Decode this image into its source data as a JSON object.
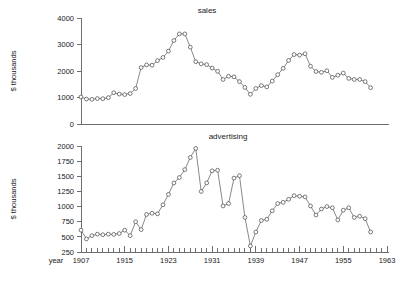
{
  "figure": {
    "ylabel": "$ thousands",
    "xlabel": "year"
  },
  "chart_data": [
    {
      "type": "line",
      "title": "sales",
      "xlabel": "",
      "ylabel": "$ thousands",
      "ylim": [
        0,
        4000
      ],
      "yticks": [
        0,
        1000,
        2000,
        3000,
        4000
      ],
      "yticklabels": [
        "0",
        "1000",
        "2000",
        "3000",
        "4000"
      ],
      "xlim": [
        1907,
        1963
      ],
      "xticks": [
        1907,
        1915,
        1923,
        1931,
        1939,
        1947,
        1955,
        1963
      ],
      "xticklabels": [
        "1907",
        "1915",
        "1923",
        "1931",
        "1939",
        "1947",
        "1955",
        "1963"
      ],
      "minor_xtick_step": 1,
      "grid": false,
      "legend": "none",
      "marker": "open-circle",
      "x": [
        1907,
        1908,
        1909,
        1910,
        1911,
        1912,
        1913,
        1914,
        1915,
        1916,
        1917,
        1918,
        1919,
        1920,
        1921,
        1922,
        1923,
        1924,
        1925,
        1926,
        1927,
        1928,
        1929,
        1930,
        1931,
        1932,
        1933,
        1934,
        1935,
        1936,
        1937,
        1938,
        1939,
        1940,
        1941,
        1942,
        1943,
        1944,
        1945,
        1946,
        1947,
        1948,
        1949,
        1950,
        1951,
        1952,
        1953,
        1954,
        1955,
        1956,
        1957,
        1958,
        1959,
        1960
      ],
      "values": [
        1020,
        940,
        930,
        960,
        955,
        995,
        1180,
        1130,
        1110,
        1150,
        1340,
        2130,
        2230,
        2220,
        2390,
        2510,
        2750,
        3150,
        3400,
        3400,
        2900,
        2350,
        2270,
        2240,
        2110,
        1990,
        1680,
        1800,
        1780,
        1600,
        1380,
        1120,
        1340,
        1450,
        1400,
        1620,
        1860,
        2100,
        2400,
        2620,
        2600,
        2650,
        2180,
        1980,
        1950,
        2010,
        1760,
        1840,
        1920,
        1720,
        1680,
        1680,
        1600,
        1370
      ]
    },
    {
      "type": "line",
      "title": "advertising",
      "xlabel": "year",
      "ylabel": "$ thousands",
      "ylim": [
        250,
        2000
      ],
      "yticks": [
        250,
        500,
        750,
        1000,
        1250,
        1500,
        1750,
        2000
      ],
      "yticklabels": [
        "250",
        "500",
        "750",
        "1000",
        "1250",
        "1500",
        "1750",
        "2000"
      ],
      "xlim": [
        1907,
        1963
      ],
      "xticks": [
        1907,
        1915,
        1923,
        1931,
        1939,
        1947,
        1955,
        1963
      ],
      "xticklabels": [
        "1907",
        "1915",
        "1923",
        "1931",
        "1939",
        "1947",
        "1955",
        "1963"
      ],
      "minor_xtick_step": 1,
      "grid": false,
      "legend": "none",
      "marker": "open-circle",
      "x": [
        1907,
        1908,
        1909,
        1910,
        1911,
        1912,
        1913,
        1914,
        1915,
        1916,
        1917,
        1918,
        1919,
        1920,
        1921,
        1922,
        1923,
        1924,
        1925,
        1926,
        1927,
        1928,
        1929,
        1930,
        1931,
        1932,
        1933,
        1934,
        1935,
        1936,
        1937,
        1938,
        1939,
        1940,
        1941,
        1942,
        1943,
        1944,
        1945,
        1946,
        1947,
        1948,
        1949,
        1950,
        1951,
        1952,
        1953,
        1954,
        1955,
        1956,
        1957,
        1958,
        1959,
        1960
      ],
      "values": [
        610,
        465,
        520,
        545,
        535,
        545,
        540,
        555,
        610,
        520,
        750,
        620,
        870,
        890,
        880,
        1030,
        1200,
        1390,
        1480,
        1610,
        1810,
        1960,
        1250,
        1390,
        1590,
        1600,
        1010,
        1050,
        1470,
        1510,
        820,
        350,
        580,
        770,
        790,
        930,
        1050,
        1070,
        1120,
        1180,
        1170,
        1160,
        1010,
        860,
        960,
        1000,
        980,
        780,
        940,
        980,
        820,
        840,
        800,
        580
      ]
    }
  ]
}
